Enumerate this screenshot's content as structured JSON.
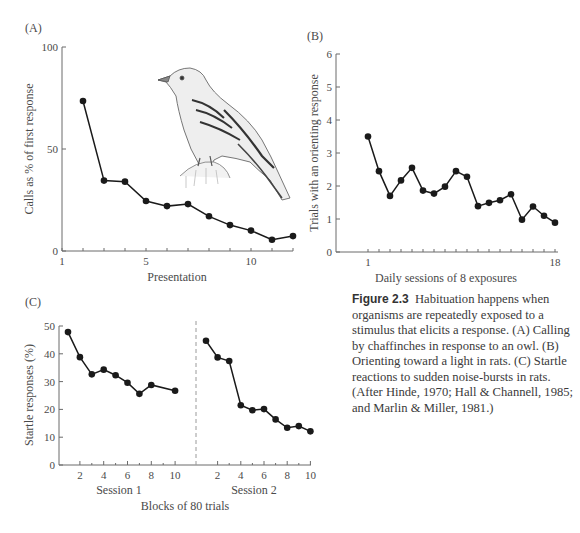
{
  "figure": {
    "label": "Figure 2.3",
    "caption": "Habituation happens when organisms are repeatedly exposed to a stimulus that elicits a response. (A) Calling by chaffinches in response to an owl. (B) Orienting toward a light in rats. (C) Startle reactions to sudden noise-bursts in rats. (After Hinde, 1970; Hall & Channell, 1985; and Marlin & Miller, 1981.)",
    "illustration": "chaffinch-drawing"
  },
  "colors": {
    "line": "#1a1a1a",
    "axis": "#6a6a6a",
    "text": "#4a4a4a",
    "dashed": "#9a9a9a"
  },
  "chart_data": [
    {
      "panel": "(A)",
      "type": "line",
      "title": "",
      "xlabel": "Presentation",
      "ylabel": "Calls as % of first response",
      "xlim": [
        1,
        12
      ],
      "ylim": [
        0,
        100
      ],
      "xticks": [
        1,
        5,
        10
      ],
      "yticks": [
        0,
        50,
        100
      ],
      "grid": false,
      "legend": null,
      "x": [
        2,
        3,
        4,
        5,
        6,
        7,
        8,
        9,
        10,
        11,
        12
      ],
      "values": [
        73.5,
        34.5,
        34,
        24.5,
        22,
        23,
        17,
        12.7,
        10,
        5.5,
        7.3
      ],
      "annotations": [
        "chaffinch illustration"
      ]
    },
    {
      "panel": "(B)",
      "type": "line",
      "title": "",
      "xlabel": "Daily sessions of 8 exposures",
      "ylabel": "Trials with an orienting response",
      "xlim": [
        1,
        18
      ],
      "ylim": [
        0,
        6
      ],
      "xticks": [
        1,
        18
      ],
      "yticks": [
        0,
        1,
        2,
        3,
        4,
        5,
        6
      ],
      "grid": false,
      "legend": null,
      "x": [
        1,
        2,
        3,
        4,
        5,
        6,
        7,
        8,
        9,
        10,
        11,
        12,
        13,
        14,
        15,
        16,
        17,
        18
      ],
      "values": [
        3.5,
        2.45,
        1.7,
        2.17,
        2.55,
        1.86,
        1.77,
        1.98,
        2.45,
        2.28,
        1.39,
        1.49,
        1.57,
        1.75,
        0.98,
        1.38,
        1.1,
        0.89
      ]
    },
    {
      "panel": "(C)",
      "type": "line",
      "title": "",
      "xlabel": "Blocks of 80 trials",
      "ylabel": "Startle responses (%)",
      "ylim": [
        0,
        50
      ],
      "yticks": [
        0,
        10,
        20,
        30,
        40,
        50
      ],
      "xticks": [
        2,
        4,
        6,
        8,
        10
      ],
      "grid": false,
      "legend": null,
      "series": [
        {
          "name": "Session 1",
          "x": [
            1,
            2,
            3,
            4,
            5,
            6,
            7,
            8,
            10
          ],
          "values": [
            47.8,
            38.8,
            32.6,
            34.3,
            32.3,
            29.6,
            25.6,
            28.8,
            26.7
          ]
        },
        {
          "name": "Session 2",
          "x": [
            1,
            2,
            3,
            4,
            5,
            6,
            7,
            8,
            9,
            10
          ],
          "values": [
            44.7,
            38.7,
            37.4,
            21.5,
            19.7,
            20.1,
            16.4,
            13.4,
            14.0,
            12.1
          ]
        }
      ],
      "session_labels": [
        "Session 1",
        "Session 2"
      ],
      "separator": "dashed vertical line between sessions"
    }
  ]
}
